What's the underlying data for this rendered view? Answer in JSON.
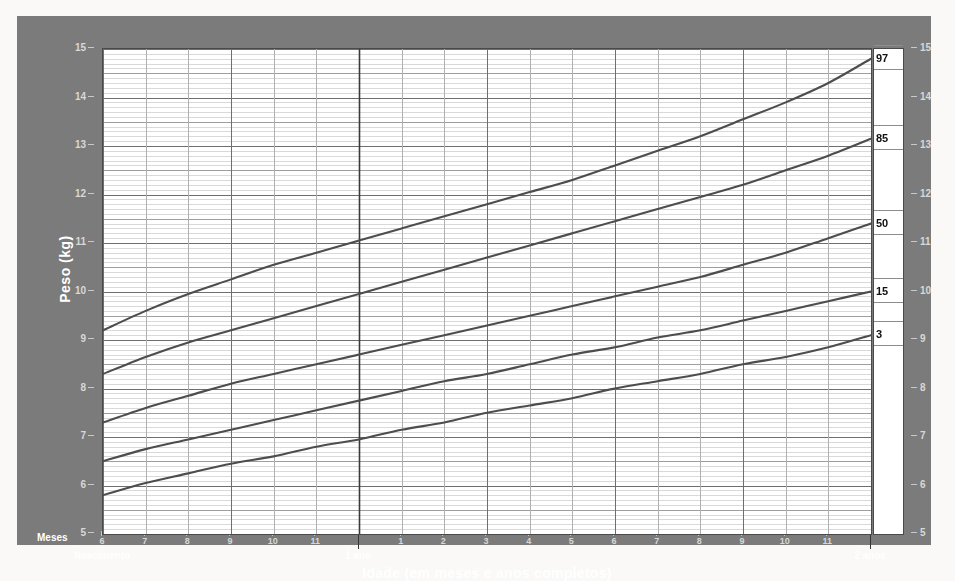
{
  "chart_data": {
    "type": "line",
    "title": "",
    "xlabel": "Idade (em meses e anos completos)",
    "ylabel": "Peso (kg)",
    "xlim": [
      6,
      24
    ],
    "ylim": [
      5,
      15
    ],
    "grid": true,
    "legend_position": "right-inline",
    "x_unit_note": "Meses",
    "x_tick_labels": [
      "6",
      "7",
      "8",
      "9",
      "10",
      "11",
      "1",
      "2",
      "3",
      "4",
      "5",
      "6",
      "7",
      "8",
      "9",
      "10",
      "11"
    ],
    "x_tick_values": [
      6,
      7,
      8,
      9,
      10,
      11,
      13,
      14,
      15,
      16,
      17,
      18,
      19,
      20,
      21,
      22,
      23
    ],
    "x_major_labels": [
      {
        "label": "Nascimento",
        "value": 6
      },
      {
        "label": "1 ano",
        "value": 12
      },
      {
        "label": "2 anos",
        "value": 24
      }
    ],
    "y_tick_labels": [
      "5",
      "6",
      "7",
      "8",
      "9",
      "10",
      "11",
      "12",
      "13",
      "14",
      "15"
    ],
    "y_tick_values": [
      5,
      6,
      7,
      8,
      9,
      10,
      11,
      12,
      13,
      14,
      15
    ],
    "x": [
      6,
      7,
      8,
      9,
      10,
      11,
      12,
      13,
      14,
      15,
      16,
      17,
      18,
      19,
      20,
      21,
      22,
      23,
      24
    ],
    "series": [
      {
        "name": "97",
        "label": "97",
        "color": "#4d4d4d",
        "values": [
          9.2,
          9.6,
          9.95,
          10.25,
          10.55,
          10.8,
          11.05,
          11.3,
          11.55,
          11.8,
          12.05,
          12.3,
          12.6,
          12.9,
          13.2,
          13.55,
          13.9,
          14.3,
          14.8
        ]
      },
      {
        "name": "85",
        "label": "85",
        "color": "#4d4d4d",
        "values": [
          8.3,
          8.65,
          8.95,
          9.2,
          9.45,
          9.7,
          9.95,
          10.2,
          10.45,
          10.7,
          10.95,
          11.2,
          11.45,
          11.7,
          11.95,
          12.2,
          12.5,
          12.8,
          13.15
        ]
      },
      {
        "name": "50",
        "label": "50",
        "color": "#4d4d4d",
        "values": [
          7.3,
          7.6,
          7.85,
          8.1,
          8.3,
          8.5,
          8.7,
          8.9,
          9.1,
          9.3,
          9.5,
          9.7,
          9.9,
          10.1,
          10.3,
          10.55,
          10.8,
          11.1,
          11.4
        ]
      },
      {
        "name": "15",
        "label": "15",
        "color": "#4d4d4d",
        "values": [
          6.5,
          6.75,
          6.95,
          7.15,
          7.35,
          7.55,
          7.75,
          7.95,
          8.15,
          8.3,
          8.5,
          8.7,
          8.85,
          9.05,
          9.2,
          9.4,
          9.6,
          9.8,
          10.0
        ]
      },
      {
        "name": "3",
        "label": "3",
        "color": "#4d4d4d",
        "values": [
          5.8,
          6.05,
          6.25,
          6.45,
          6.6,
          6.8,
          6.95,
          7.15,
          7.3,
          7.5,
          7.65,
          7.8,
          8.0,
          8.15,
          8.3,
          8.5,
          8.65,
          8.85,
          9.1
        ]
      }
    ]
  },
  "colors": {
    "panel_background": "#7b7b7b",
    "plot_background": "#ffffff",
    "curve": "#4d4d4d",
    "grid_minor": "#d0d0d0",
    "grid_major": "#8a8a8a",
    "tick_text": "#d8d8d8",
    "axis_title_text": "#ffffff",
    "percentile_text": "#111111"
  }
}
